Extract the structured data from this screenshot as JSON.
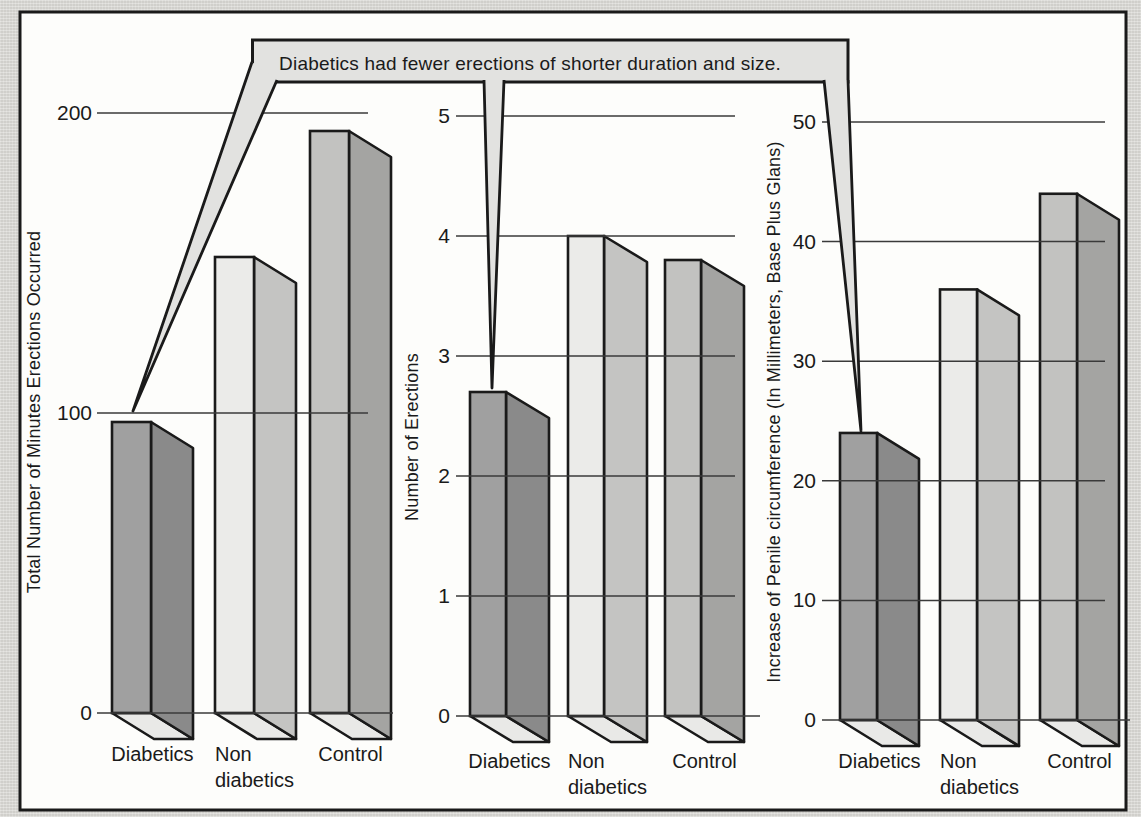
{
  "figure": {
    "kind": "scanned-textbook-bar-chart-figure"
  },
  "annotation": {
    "text": "Diabetics had fewer erections of shorter duration and size.",
    "points_to": [
      "Diabetics bar of left chart",
      "Diabetics bar of middle chart",
      "Diabetics bar of right chart"
    ]
  },
  "colors": {
    "page_bg": "#d8d7d3",
    "figure_bg": "#fdfdfb",
    "frame_border": "#1a1a1a",
    "outline": "#1a1a1a",
    "gridline": "#3a3a3a",
    "text": "#1a1a1a",
    "callout_fill": "#e2e2e0",
    "base_face": "#e9e9e7",
    "bar_faces": [
      {
        "category": "Diabetics",
        "front": "#a0a0a0",
        "side": "#8a8a8a"
      },
      {
        "category": "Non diabetics",
        "front": "#ebebe9",
        "side": "#c4c4c2"
      },
      {
        "category": "Control",
        "front": "#c2c2c0",
        "side": "#a4a4a2"
      }
    ]
  },
  "chart_data": [
    {
      "type": "bar",
      "title": "",
      "ylabel": "Total Number of Minutes Erections Occurred",
      "xlabel": "",
      "categories": [
        "Diabetics",
        "Non diabetics",
        "Control"
      ],
      "values": [
        97,
        152,
        194
      ],
      "ylim": [
        0,
        200
      ],
      "yticks": [
        0,
        100,
        200
      ],
      "grid": true,
      "legend": false,
      "style": "3d-oblique"
    },
    {
      "type": "bar",
      "title": "",
      "ylabel": "Number of Erections",
      "xlabel": "",
      "categories": [
        "Diabetics",
        "Non diabetics",
        "Control"
      ],
      "values": [
        2.7,
        4,
        3.8
      ],
      "ylim": [
        0,
        5
      ],
      "yticks": [
        0,
        1,
        2,
        3,
        4,
        5
      ],
      "grid": true,
      "legend": false,
      "style": "3d-oblique"
    },
    {
      "type": "bar",
      "title": "",
      "ylabel": "Increase of Penile circumference (In Millimeters, Base Plus Glans)",
      "xlabel": "",
      "categories": [
        "Diabetics",
        "Non diabetics",
        "Control"
      ],
      "values": [
        24,
        36,
        44
      ],
      "ylim": [
        0,
        50
      ],
      "yticks": [
        0,
        10,
        20,
        30,
        40,
        50
      ],
      "grid": true,
      "legend": false,
      "style": "3d-oblique"
    }
  ]
}
